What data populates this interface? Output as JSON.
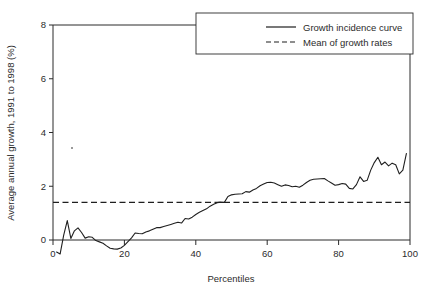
{
  "figure": {
    "background_color": "#ffffff",
    "line_color": "#1f1f1f",
    "axis_color": "#2b2b2b"
  },
  "axes": {
    "x_title": "Percentiles",
    "y_title": "Average annual growth, 1991 to 1998 (%)",
    "x_ticks": [
      "0",
      "20",
      "40",
      "60",
      "80",
      "100"
    ],
    "y_ticks": [
      "0",
      "2",
      "4",
      "6",
      "8"
    ]
  },
  "legend": {
    "items": [
      {
        "label": "Growth incidence curve",
        "style": "solid"
      },
      {
        "label": "Mean of growth rates",
        "style": "dashed"
      }
    ]
  },
  "chart_data": {
    "type": "line",
    "title": "",
    "subtitle": "",
    "xlabel": "Percentiles",
    "ylabel": "Average annual growth, 1991 to 1998 (%)",
    "xlim": [
      0,
      100
    ],
    "ylim": [
      -0.75,
      8
    ],
    "xticks": [
      0,
      20,
      40,
      60,
      80,
      100
    ],
    "yticks": [
      0,
      2,
      4,
      6,
      8
    ],
    "grid": false,
    "legend_position": "top-right",
    "annotations": [],
    "series": [
      {
        "name": "Growth incidence curve",
        "style": "solid",
        "x": [
          1,
          2,
          3,
          4,
          5,
          6,
          7,
          8,
          9,
          10,
          11,
          12,
          13,
          14,
          15,
          16,
          17,
          18,
          19,
          20,
          21,
          22,
          23,
          24,
          25,
          26,
          27,
          28,
          29,
          30,
          31,
          32,
          33,
          34,
          35,
          36,
          37,
          38,
          39,
          40,
          41,
          42,
          43,
          44,
          45,
          46,
          47,
          48,
          49,
          50,
          51,
          52,
          53,
          54,
          55,
          56,
          57,
          58,
          59,
          60,
          61,
          62,
          63,
          64,
          65,
          66,
          67,
          68,
          69,
          70,
          71,
          72,
          73,
          74,
          75,
          76,
          77,
          78,
          79,
          80,
          81,
          82,
          83,
          84,
          85,
          86,
          87,
          88,
          89,
          90,
          91,
          92,
          93,
          94,
          95,
          96,
          97,
          98,
          99
        ],
        "y": [
          -0.45,
          -0.52,
          0.18,
          0.72,
          0.06,
          0.34,
          0.45,
          0.28,
          0.07,
          0.12,
          0.1,
          -0.02,
          -0.07,
          -0.12,
          -0.22,
          -0.31,
          -0.33,
          -0.34,
          -0.3,
          -0.2,
          -0.06,
          0.08,
          0.26,
          0.24,
          0.23,
          0.3,
          0.34,
          0.4,
          0.46,
          0.46,
          0.5,
          0.54,
          0.58,
          0.62,
          0.66,
          0.63,
          0.8,
          0.78,
          0.85,
          0.95,
          1.03,
          1.1,
          1.16,
          1.26,
          1.33,
          1.39,
          1.41,
          1.4,
          1.62,
          1.68,
          1.7,
          1.71,
          1.72,
          1.8,
          1.78,
          1.86,
          1.92,
          2.02,
          2.08,
          2.14,
          2.15,
          2.12,
          2.06,
          2.0,
          2.05,
          2.03,
          1.98,
          2.0,
          1.96,
          2.04,
          2.14,
          2.22,
          2.26,
          2.27,
          2.28,
          2.29,
          2.2,
          2.12,
          2.04,
          2.06,
          2.1,
          2.08,
          1.92,
          1.9,
          2.06,
          2.35,
          2.18,
          2.22,
          2.6,
          2.88,
          3.08,
          2.8,
          2.9,
          2.76,
          2.86,
          2.8,
          2.46,
          2.6,
          3.22
        ]
      },
      {
        "name": "Mean of growth rates",
        "style": "dashed",
        "value": 1.4
      }
    ]
  }
}
